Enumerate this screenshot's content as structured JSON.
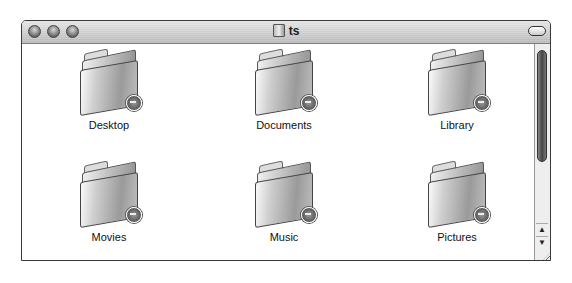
{
  "window": {
    "title": "ts",
    "title_icon": "folder-icon",
    "traffic_lights": [
      "close",
      "minimize",
      "zoom"
    ]
  },
  "items": [
    {
      "label": "Desktop",
      "icon": "folder-icon",
      "badge": "locked-badge"
    },
    {
      "label": "Documents",
      "icon": "folder-icon",
      "badge": "locked-badge"
    },
    {
      "label": "Library",
      "icon": "folder-icon",
      "badge": "locked-badge"
    },
    {
      "label": "Movies",
      "icon": "folder-icon",
      "badge": "locked-badge"
    },
    {
      "label": "Music",
      "icon": "folder-icon",
      "badge": "locked-badge"
    },
    {
      "label": "Pictures",
      "icon": "folder-icon",
      "badge": "locked-badge"
    }
  ],
  "scrollbar": {
    "up_arrow": "▲",
    "down_arrow": "▼"
  }
}
